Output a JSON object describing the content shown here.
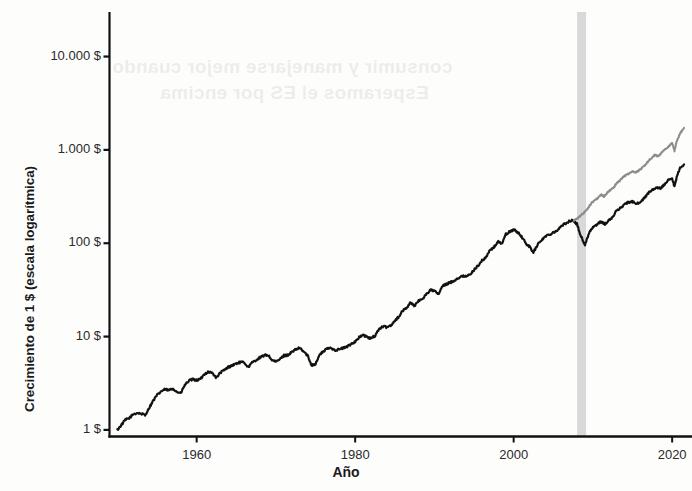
{
  "chart_data": {
    "type": "line",
    "title": "",
    "xlabel": "Año",
    "ylabel": "Crecimiento de 1 $ (escala logarítmica)",
    "yscale": "log",
    "xlim": [
      1949,
      2022
    ],
    "ylim": [
      0.85,
      30000
    ],
    "grid": false,
    "legend": "none",
    "ytick_labels": [
      "10.000 $",
      "1.000 $",
      "100 $",
      "10 $",
      "1 $"
    ],
    "ytick_values": [
      10000,
      1000,
      100,
      10,
      1
    ],
    "xtick_labels": [
      "1960",
      "1980",
      "2000",
      "2020"
    ],
    "xtick_values": [
      1960,
      1980,
      2000,
      2020
    ],
    "annotations": [
      {
        "name": "recession-band",
        "type": "vspan",
        "x_start": 2008,
        "x_end": 2009.1,
        "color": "#d9d9d9"
      }
    ],
    "series": [
      {
        "name": "serie-negra",
        "color": "#121212",
        "x": [
          1950.0,
          1950.5,
          1951.0,
          1951.5,
          1952.0,
          1952.5,
          1953.0,
          1953.5,
          1954.0,
          1954.5,
          1955.0,
          1955.5,
          1956.0,
          1956.5,
          1957.0,
          1957.5,
          1958.0,
          1958.5,
          1959.0,
          1959.5,
          1960.0,
          1960.5,
          1961.0,
          1961.5,
          1962.0,
          1962.5,
          1963.0,
          1963.5,
          1964.0,
          1964.5,
          1965.0,
          1965.5,
          1966.0,
          1966.5,
          1967.0,
          1967.5,
          1968.0,
          1968.5,
          1969.0,
          1969.5,
          1970.0,
          1970.5,
          1971.0,
          1971.5,
          1972.0,
          1972.5,
          1973.0,
          1973.5,
          1974.0,
          1974.5,
          1975.0,
          1975.5,
          1976.0,
          1976.5,
          1977.0,
          1977.5,
          1978.0,
          1978.5,
          1979.0,
          1979.5,
          1980.0,
          1980.5,
          1981.0,
          1981.5,
          1982.0,
          1982.5,
          1983.0,
          1983.5,
          1984.0,
          1984.5,
          1985.0,
          1985.5,
          1986.0,
          1986.5,
          1987.0,
          1987.5,
          1988.0,
          1988.5,
          1989.0,
          1989.5,
          1990.0,
          1990.5,
          1991.0,
          1991.5,
          1992.0,
          1992.5,
          1993.0,
          1993.5,
          1994.0,
          1994.5,
          1995.0,
          1995.5,
          1996.0,
          1996.5,
          1997.0,
          1997.5,
          1998.0,
          1998.5,
          1999.0,
          1999.5,
          2000.0,
          2000.5,
          2001.0,
          2001.5,
          2002.0,
          2002.5,
          2003.0,
          2003.5,
          2004.0,
          2004.5,
          2005.0,
          2005.5,
          2006.0,
          2006.5,
          2007.0,
          2007.5,
          2008.0,
          2008.5,
          2009.0,
          2009.5,
          2010.0,
          2010.5,
          2011.0,
          2011.5,
          2012.0,
          2012.5,
          2013.0,
          2013.5,
          2014.0,
          2014.5,
          2015.0,
          2015.5,
          2016.0,
          2016.5,
          2017.0,
          2017.5,
          2018.0,
          2018.5,
          2019.0,
          2019.5,
          2020.0,
          2020.3,
          2020.6,
          2021.0,
          2021.5
        ],
        "y": [
          1.0,
          1.13,
          1.28,
          1.34,
          1.47,
          1.52,
          1.49,
          1.44,
          1.72,
          2.05,
          2.35,
          2.58,
          2.72,
          2.66,
          2.78,
          2.55,
          2.48,
          3.02,
          3.35,
          3.48,
          3.4,
          3.52,
          3.98,
          4.2,
          4.05,
          3.62,
          4.12,
          4.38,
          4.72,
          4.92,
          5.15,
          5.3,
          5.28,
          4.7,
          5.25,
          5.62,
          5.95,
          6.28,
          6.35,
          5.6,
          5.35,
          5.72,
          6.25,
          6.35,
          6.8,
          7.25,
          7.55,
          6.9,
          6.25,
          4.95,
          5.1,
          6.35,
          6.95,
          7.45,
          7.55,
          7.15,
          7.3,
          7.55,
          7.8,
          8.35,
          8.85,
          9.8,
          10.4,
          9.85,
          9.55,
          10.2,
          12.0,
          12.8,
          12.6,
          13.2,
          14.8,
          16.3,
          18.9,
          20.4,
          23.2,
          21.3,
          24.0,
          25.5,
          28.6,
          31.5,
          31.0,
          28.2,
          34.5,
          36.4,
          38.0,
          39.8,
          42.5,
          44.1,
          44.8,
          45.6,
          52.0,
          57.5,
          65.0,
          70.5,
          84.0,
          90.0,
          104.0,
          99.0,
          124.0,
          133.0,
          140.0,
          131.0,
          118.0,
          100.0,
          92.0,
          80.0,
          96.0,
          108.0,
          118.0,
          124.0,
          131.0,
          137.0,
          152.0,
          162.0,
          172.0,
          175.0,
          160.0,
          118.0,
          96.0,
          128.0,
          150.0,
          156.0,
          172.0,
          160.0,
          175.0,
          190.0,
          225.0,
          240.0,
          262.0,
          275.0,
          278.0,
          262.0,
          280.0,
          305.0,
          345.0,
          370.0,
          400.0,
          385.0,
          420.0,
          470.0,
          490.0,
          400.0,
          520.0,
          640.0,
          700.0
        ]
      },
      {
        "name": "serie-gris",
        "color": "#8c8c8c",
        "x": [
          2007.6,
          2008.0,
          2008.4,
          2008.8,
          2009.0,
          2009.4,
          2009.8,
          2010.2,
          2010.6,
          2011.0,
          2011.4,
          2011.8,
          2012.2,
          2012.6,
          2013.0,
          2013.4,
          2013.8,
          2014.2,
          2014.6,
          2015.0,
          2015.4,
          2015.8,
          2016.2,
          2016.6,
          2017.0,
          2017.4,
          2017.8,
          2018.2,
          2018.6,
          2019.0,
          2019.4,
          2019.8,
          2020.0,
          2020.3,
          2020.6,
          2021.0,
          2021.5
        ],
        "y": [
          176.0,
          182.0,
          196.0,
          210.0,
          218.0,
          240.0,
          268.0,
          290.0,
          300.0,
          330.0,
          318.0,
          345.0,
          372.0,
          395.0,
          440.0,
          470.0,
          510.0,
          540.0,
          560.0,
          590.0,
          575.0,
          600.0,
          640.0,
          690.0,
          760.0,
          820.0,
          880.0,
          860.0,
          920.0,
          1000.0,
          1060.0,
          1140.0,
          1180.0,
          980.0,
          1250.0,
          1500.0,
          1720.0
        ]
      }
    ]
  },
  "bleed_text": {
    "line1": "consumir y manejarse mejor cuando",
    "line2": "Esperamos el ES por encima"
  }
}
